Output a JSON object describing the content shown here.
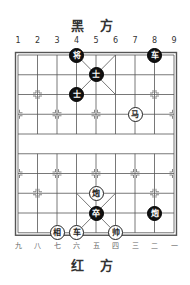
{
  "top_title": "黑 方",
  "bottom_title": "红 方",
  "top_labels": [
    "1",
    "2",
    "3",
    "4",
    "5",
    "6",
    "7",
    "8",
    "9"
  ],
  "bottom_labels": [
    "九",
    "八",
    "七",
    "六",
    "五",
    "四",
    "三",
    "二",
    "一"
  ],
  "board": {
    "origin_x": 18,
    "origin_y": 55,
    "dx": 19.5,
    "dy": 19.75,
    "line_color": "#555555"
  },
  "pieces": [
    {
      "side": "black",
      "char": "将",
      "col": 3,
      "row": 0
    },
    {
      "side": "black",
      "char": "车",
      "col": 7,
      "row": 0
    },
    {
      "side": "black",
      "char": "士",
      "col": 4,
      "row": 1
    },
    {
      "side": "black",
      "char": "士",
      "col": 3,
      "row": 2
    },
    {
      "side": "red",
      "char": "马",
      "col": 6,
      "row": 3
    },
    {
      "side": "red",
      "char": "炮",
      "col": 4,
      "row": 7
    },
    {
      "side": "black",
      "char": "卒",
      "col": 4,
      "row": 8
    },
    {
      "side": "black",
      "char": "炮",
      "col": 7,
      "row": 8
    },
    {
      "side": "red",
      "char": "相",
      "col": 2,
      "row": 9
    },
    {
      "side": "red",
      "char": "车",
      "col": 3,
      "row": 9
    },
    {
      "side": "red",
      "char": "帅",
      "col": 5,
      "row": 9
    }
  ]
}
